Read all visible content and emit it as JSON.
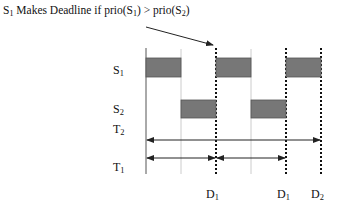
{
  "title": {
    "prefix": "S",
    "prefix_sub": "1",
    "text": " Makes Deadline if prio(S",
    "sub1": "1",
    "mid": ") > prio(S",
    "sub2": "2",
    "suffix": ")"
  },
  "rows": [
    {
      "id": "S1",
      "label": "S",
      "sub": "1"
    },
    {
      "id": "S2",
      "label": "S",
      "sub": "2"
    },
    {
      "id": "T2",
      "label": "T",
      "sub": "2"
    },
    {
      "id": "T1",
      "label": "T",
      "sub": "1"
    }
  ],
  "deadlines": [
    {
      "label": "D",
      "sub": "1"
    },
    {
      "label": "D",
      "sub": "1"
    },
    {
      "label": "D",
      "sub": "2"
    }
  ],
  "colors": {
    "box_fill": "#777777",
    "box_stroke": "#444444",
    "axis": "#555555",
    "light_line": "#cccccc",
    "dotted": "#111111",
    "arrow": "#222222"
  }
}
